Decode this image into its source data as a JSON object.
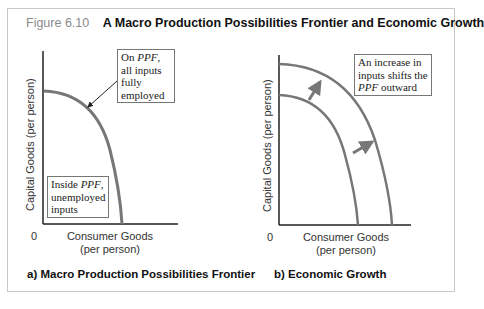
{
  "figure": {
    "number": "Figure 6.10",
    "title": "A Macro Production Possibilities Frontier and Economic Growth"
  },
  "panel_a": {
    "caption": "a) Macro Production Possibilities Frontier",
    "y_axis_label": "Capital Goods (per person)",
    "x_axis_label_line1": "Consumer Goods",
    "x_axis_label_line2": "(per person)",
    "origin_label": "0",
    "note_on_ppf": {
      "pre": "On ",
      "em": "PPF",
      "post": ", all inputs fully employed"
    },
    "note_inside_ppf": {
      "pre": "Inside ",
      "em": "PPF",
      "post": ", unemployed inputs"
    }
  },
  "panel_b": {
    "caption": "b) Economic Growth",
    "y_axis_label": "Capital Goods (per person)",
    "x_axis_label_line1": "Consumer Goods",
    "x_axis_label_line2": "(per person)",
    "origin_label": "0",
    "note_shift": {
      "pre": "An increase in inputs shifts the ",
      "em": "PPF",
      "post": " outward"
    }
  },
  "colors": {
    "curve": "#777777",
    "axis": "#222222",
    "figure_number": "#8a8a8a",
    "frame_border": "#c8c8c8"
  }
}
